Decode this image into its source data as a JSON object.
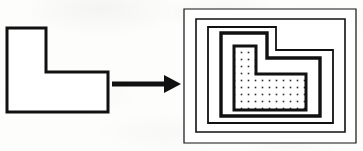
{
  "figure": {
    "name": "offset-contours-of-l-shaped-polygon",
    "canvas": {
      "width": 363,
      "height": 151
    },
    "background_color": "#fdfdfc",
    "ink_color": "#111111",
    "fill_color": "#ffffff",
    "stipple_color": "#2a2a2a"
  },
  "left_panel": {
    "name": "source-l-polygon",
    "description": "outline L-shaped polygon",
    "stroke_width": 3,
    "fill": "#ffffff",
    "points": "7,28 46,28 46,72 108,72 108,112 7,112"
  },
  "arrow": {
    "name": "transformation-arrow",
    "direction": "right",
    "shaft": {
      "x1": 112,
      "y1": 84,
      "x2": 168,
      "y2": 84,
      "width": 5
    },
    "head": {
      "points": "166,76 180,84 166,92"
    },
    "color": "#111111"
  },
  "right_panel": {
    "name": "offset-contour-stack",
    "description": "nested inward offset contours of the L-shaped polygon",
    "layers": [
      {
        "name": "outer-boundary-rect",
        "shape": "rect",
        "stroke_width": 1.2,
        "points": "184,9 356,9 356,143 184,143"
      },
      {
        "name": "offset-contour-1",
        "shape": "rect",
        "stroke_width": 1.6,
        "points": "196,19 345,19 345,132 196,132"
      },
      {
        "name": "offset-contour-2",
        "shape": "l-notched",
        "stroke_width": 1.8,
        "points": "208,27 276,27 276,50 333,50 333,123 208,123"
      },
      {
        "name": "offset-contour-3-thick",
        "shape": "l-notched",
        "stroke_width": 3.4,
        "points": "221,33 267,33 267,58 320,58 320,116 221,116"
      },
      {
        "name": "core-l-stippled",
        "shape": "l-notched",
        "stroke_width": 3.0,
        "fill": "stipple",
        "points": "234,46 256,46 256,74 306,74 306,110 234,110"
      }
    ],
    "stipple": {
      "name": "dot-fill-pattern",
      "spacing": 7,
      "dot_size": 1.6
    }
  }
}
